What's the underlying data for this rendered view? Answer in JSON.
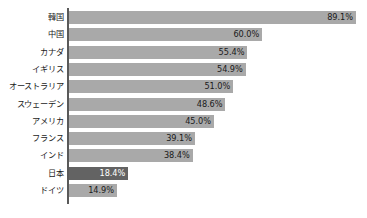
{
  "chart_data": {
    "type": "bar",
    "orientation": "horizontal",
    "title": "",
    "subtitle": "",
    "xlabel": "",
    "ylabel": "",
    "xlim": [
      0,
      92
    ],
    "grid": false,
    "legend": false,
    "value_suffix": "%",
    "categories": [
      "韓国",
      "中国",
      "カナダ",
      "イギリス",
      "オーストラリア",
      "スウェーデン",
      "アメリカ",
      "フランス",
      "インド",
      "日本",
      "ドイツ"
    ],
    "values": [
      89.1,
      60.0,
      55.4,
      54.9,
      51.0,
      48.6,
      45.0,
      39.1,
      38.4,
      18.4,
      14.9
    ],
    "value_labels": [
      "89.1%",
      "60.0%",
      "55.4%",
      "54.9%",
      "51.0%",
      "48.6%",
      "45.0%",
      "39.1%",
      "38.4%",
      "18.4%",
      "14.9%"
    ],
    "highlight_index": 9,
    "colors": {
      "bar": "#a9a9a9",
      "bar_highlight": "#636363",
      "axis": "#595959",
      "text": "#1a1a1a",
      "text_on_highlight": "#ffffff",
      "background": "#ffffff"
    }
  },
  "rows": [
    {
      "label": "韓国",
      "value_label": "89.1%",
      "value": 89.1,
      "highlight": false
    },
    {
      "label": "中国",
      "value_label": "60.0%",
      "value": 60.0,
      "highlight": false
    },
    {
      "label": "カナダ",
      "value_label": "55.4%",
      "value": 55.4,
      "highlight": false
    },
    {
      "label": "イギリス",
      "value_label": "54.9%",
      "value": 54.9,
      "highlight": false
    },
    {
      "label": "オーストラリア",
      "value_label": "51.0%",
      "value": 51.0,
      "highlight": false
    },
    {
      "label": "スウェーデン",
      "value_label": "48.6%",
      "value": 48.6,
      "highlight": false
    },
    {
      "label": "アメリカ",
      "value_label": "45.0%",
      "value": 45.0,
      "highlight": false
    },
    {
      "label": "フランス",
      "value_label": "39.1%",
      "value": 39.1,
      "highlight": false
    },
    {
      "label": "インド",
      "value_label": "38.4%",
      "value": 38.4,
      "highlight": false
    },
    {
      "label": "日本",
      "value_label": "18.4%",
      "value": 18.4,
      "highlight": true
    },
    {
      "label": "ドイツ",
      "value_label": "14.9%",
      "value": 14.9,
      "highlight": false
    }
  ]
}
